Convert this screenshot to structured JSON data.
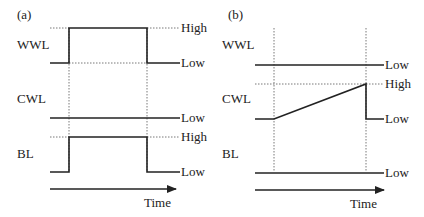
{
  "diagram": {
    "type": "timing-diagram",
    "panels": [
      {
        "id": "a",
        "label": "(a)",
        "signals": [
          {
            "name": "WWL",
            "levels": {
              "high": "High",
              "low": "Low"
            },
            "waveform": "pulse-high"
          },
          {
            "name": "CWL",
            "levels": {
              "low": "Low"
            },
            "waveform": "constant-low"
          },
          {
            "name": "BL",
            "levels": {
              "high": "High",
              "low": "Low"
            },
            "waveform": "pulse-high"
          }
        ],
        "axis_label": "Time"
      },
      {
        "id": "b",
        "label": "(b)",
        "signals": [
          {
            "name": "WWL",
            "levels": {
              "low": "Low"
            },
            "waveform": "constant-low"
          },
          {
            "name": "CWL",
            "levels": {
              "high": "High",
              "low": "Low"
            },
            "waveform": "ramp-up-then-drop"
          },
          {
            "name": "BL",
            "levels": {
              "low": "Low"
            },
            "waveform": "constant-low"
          }
        ],
        "axis_label": "Time"
      }
    ]
  },
  "colors": {
    "line": "#222222",
    "dotted": "#555555",
    "background": "#ffffff"
  }
}
